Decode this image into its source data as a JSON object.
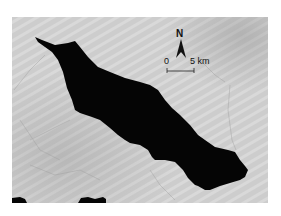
{
  "map": {
    "type": "satellite-image",
    "subject": "lake",
    "colors": {
      "land": "#c9c9c9",
      "land_light": "#d8d8d8",
      "land_dark": "#a9a9a9",
      "water": "#050505",
      "annotation": "#111111"
    }
  },
  "north_arrow": {
    "label": "N"
  },
  "scale_bar": {
    "start_label": "0",
    "end_label": "5 km"
  }
}
